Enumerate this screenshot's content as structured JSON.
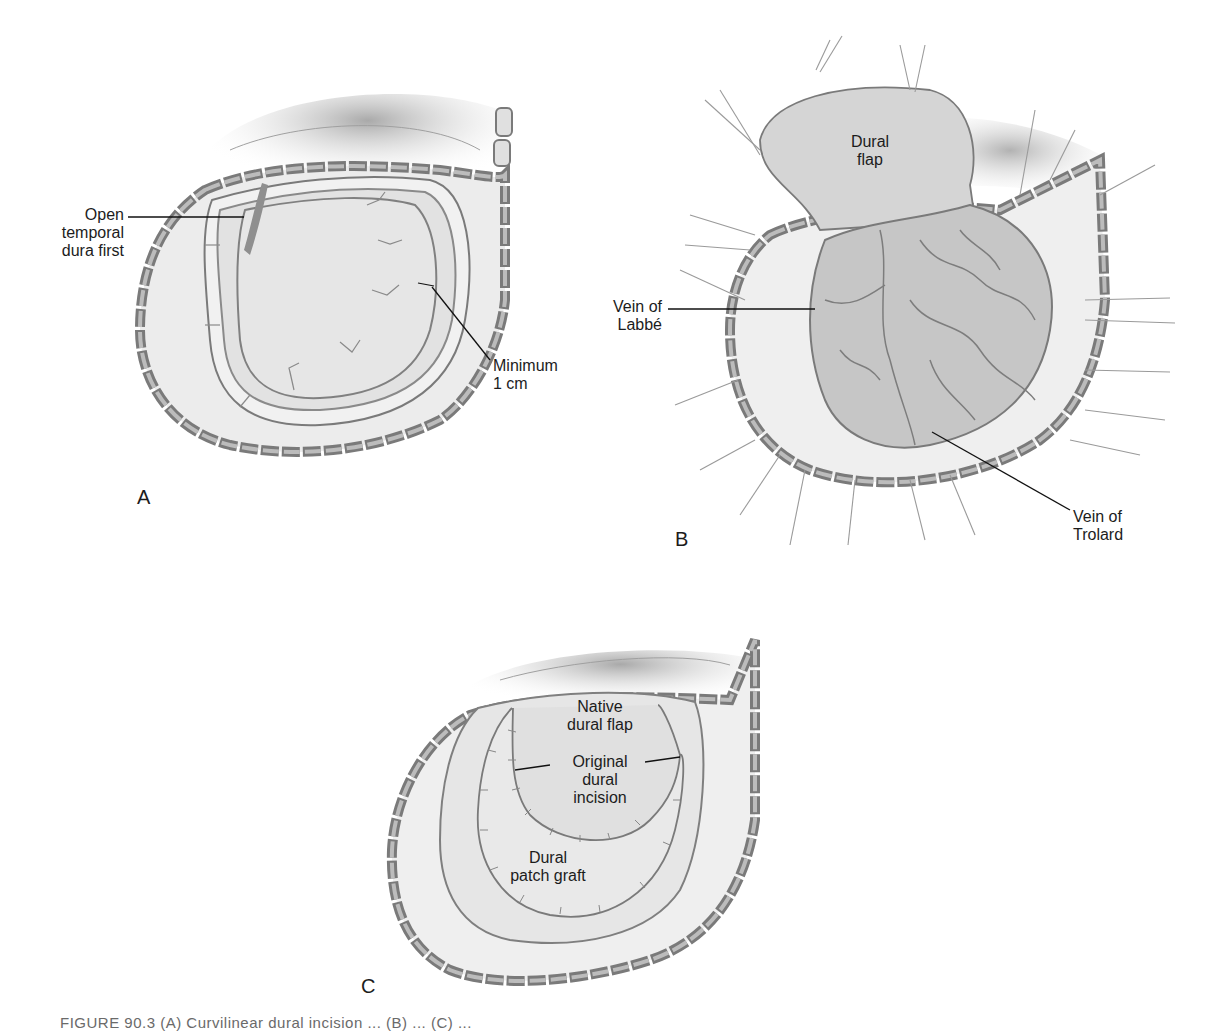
{
  "figure": {
    "panels": [
      {
        "id": "A",
        "letter": "A",
        "labels": {
          "open_temporal_line1": "Open",
          "open_temporal_line2": "temporal",
          "open_temporal_line3": "dura first",
          "minimum_line1": "Minimum",
          "minimum_line2": "1 cm"
        }
      },
      {
        "id": "B",
        "letter": "B",
        "labels": {
          "dural_flap_line1": "Dural",
          "dural_flap_line2": "flap",
          "labbe_line1": "Vein of",
          "labbe_line2": "Labbé",
          "trolard_line1": "Vein of",
          "trolard_line2": "Trolard"
        }
      },
      {
        "id": "C",
        "letter": "C",
        "labels": {
          "native_line1": "Native",
          "native_line2": "dural flap",
          "original_line1": "Original",
          "original_line2": "dural",
          "original_line3": "incision",
          "patch_line1": "Dural",
          "patch_line2": "patch graft"
        }
      }
    ],
    "caption_partial": "FIGURE 90.3 (A) Curvilinear dural incision ... (B) ... (C) ..."
  },
  "colors": {
    "background": "#ffffff",
    "bone_fill": "#e6e6e6",
    "bone_inner": "#b9b9b9",
    "outline": "#7a7a7a",
    "dura": "#dcdcdc",
    "brain": "#c9c9c9",
    "scalp_shadow": "#bdbdbd",
    "leader_line": "#111111"
  }
}
